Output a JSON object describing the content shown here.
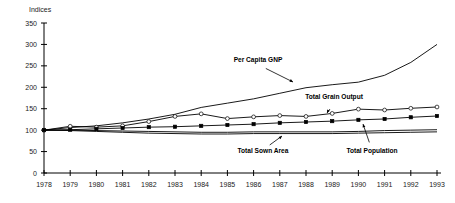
{
  "chart_data": {
    "type": "line",
    "title": "",
    "xlabel": "",
    "ylabel": "Indices",
    "ylim": [
      0,
      350
    ],
    "ytick_labels": [
      "0",
      "50",
      "100",
      "150",
      "200",
      "250",
      "300",
      "350"
    ],
    "yticks": [
      0,
      50,
      100,
      150,
      200,
      250,
      300,
      350
    ],
    "grid": false,
    "legend_position": "inline-annotations",
    "x": [
      1978,
      1979,
      1980,
      1981,
      1982,
      1983,
      1984,
      1985,
      1986,
      1987,
      1988,
      1989,
      1990,
      1991,
      1992,
      1993
    ],
    "categories": [
      "1978",
      "1979",
      "1980",
      "1981",
      "1982",
      "1983",
      "1984",
      "1985",
      "1986",
      "1987",
      "1988",
      "1989",
      "1990",
      "1991",
      "1992",
      "1993"
    ],
    "series": [
      {
        "name": "Per Capita GNP",
        "marker": "none",
        "values": [
          100,
          106,
          110,
          117,
          126,
          137,
          153,
          163,
          173,
          186,
          199,
          206,
          212,
          228,
          258,
          300
        ]
      },
      {
        "name": "Total Grain Output",
        "marker": "open-circle",
        "values": [
          100,
          109,
          107,
          110,
          120,
          132,
          138,
          127,
          131,
          134,
          132,
          139,
          149,
          147,
          151,
          154
        ]
      },
      {
        "name": "Total Population",
        "marker": "filled-square",
        "values": [
          100,
          101,
          103,
          105,
          107,
          108,
          110,
          112,
          114,
          117,
          119,
          121,
          124,
          126,
          130,
          133
        ]
      },
      {
        "name": "Total Sown Area",
        "marker": "none",
        "values": [
          100,
          100,
          99,
          98,
          97,
          96,
          95,
          95,
          96,
          96,
          96,
          96,
          97,
          99,
          100,
          101
        ]
      },
      {
        "name": "Total Sown Area (lower)",
        "marker": "none",
        "values": [
          100,
          99,
          97,
          95,
          93,
          92,
          91,
          91,
          92,
          92,
          92,
          92,
          93,
          94,
          95,
          96
        ]
      }
    ],
    "annotations": [
      {
        "label": "Per Capita GNP",
        "text_x": 258,
        "text_y": 62,
        "tip_x": 293,
        "tip_y": 82
      },
      {
        "label": "Total Grain Output",
        "text_x": 334,
        "text_y": 99,
        "tip_x": 327,
        "tip_y": 113
      },
      {
        "label": "Total Sown Area",
        "text_x": 263,
        "text_y": 153,
        "tip_x": 282,
        "tip_y": 136
      },
      {
        "label": "Total Population",
        "text_x": 372,
        "text_y": 153,
        "tip_x": 363,
        "tip_y": 124
      }
    ],
    "colors": {
      "ink": "#000000",
      "background": "#ffffff"
    }
  }
}
